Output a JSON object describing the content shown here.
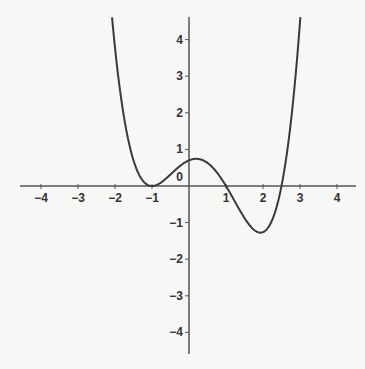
{
  "chart_data": {
    "type": "line",
    "title": "",
    "xlabel": "",
    "ylabel": "",
    "xlim": [
      -4.6,
      4.6
    ],
    "ylim": [
      -4.6,
      4.6
    ],
    "grid": false,
    "x_ticks": [
      -4,
      -3,
      -2,
      -1,
      1,
      2,
      3,
      4
    ],
    "x_tick_labels": [
      "−4",
      "−3",
      "−2",
      "−1",
      "1",
      "2",
      "3",
      "4"
    ],
    "y_ticks": [
      4,
      3,
      2,
      1,
      -1,
      -2,
      -3,
      -4
    ],
    "y_tick_labels": [
      "4",
      "3",
      "2",
      "1",
      "−1",
      "−2",
      "−3",
      "−4"
    ],
    "origin_label": "0",
    "series": [
      {
        "name": "f(x)",
        "description": "polynomial with double root at x=-1, roots at x=1 and x≈2.5, local max ≈(0.2,0.7), local min ≈(1.9,-1.3)",
        "roots": [
          -1,
          1,
          2.5
        ],
        "coefficient": 0.28,
        "key_points": [
          {
            "x": -2.1,
            "y": 4.6
          },
          {
            "x": -1,
            "y": 0
          },
          {
            "x": 0.2,
            "y": 0.7
          },
          {
            "x": 1,
            "y": 0
          },
          {
            "x": 1.9,
            "y": -1.3
          },
          {
            "x": 2.5,
            "y": 0
          },
          {
            "x": 3.05,
            "y": 4.6
          }
        ]
      }
    ]
  },
  "colors": {
    "axis": "#555555",
    "curve": "#3a3a3a",
    "background": "#f7f7f5"
  }
}
